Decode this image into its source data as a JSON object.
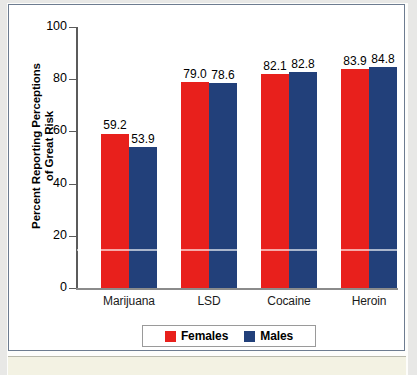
{
  "chart_data": {
    "type": "bar",
    "title": "",
    "subtitle": "",
    "xlabel": "",
    "ylabel": "Percent Reporting Perceptions of Great Risk",
    "ylabel_line1": "Percent Reporting Perceptions",
    "ylabel_line2": "of Great Risk",
    "ylim": [
      0,
      100
    ],
    "ytick_labels": [
      "100",
      "80",
      "60",
      "40",
      "20",
      "0"
    ],
    "ytick_values": [
      100,
      80,
      60,
      40,
      20,
      0
    ],
    "grid": false,
    "legend_position": "bottom-center",
    "categories": [
      "Marijuana",
      "LSD",
      "Cocaine",
      "Heroin"
    ],
    "series": [
      {
        "name": "Females",
        "color": "#e8201c",
        "values": [
          59.2,
          79.0,
          82.1,
          83.9
        ],
        "labels": [
          "59.2",
          "79.0",
          "82.1",
          "83.9"
        ]
      },
      {
        "name": "Males",
        "color": "#22407a",
        "values": [
          53.9,
          78.6,
          82.8,
          84.8
        ],
        "labels": [
          "53.9",
          "78.6",
          "82.8",
          "84.8"
        ]
      }
    ]
  },
  "legend": {
    "items": [
      {
        "label": "Females",
        "color": "#e8201c",
        "swatch": "legend-swatch-females"
      },
      {
        "label": "Males",
        "color": "#22407a",
        "swatch": "legend-swatch-males"
      }
    ]
  },
  "colors": {
    "female_bar": "#e8201c",
    "male_bar": "#22407a",
    "frame_border": "#6d7c90",
    "caption_band": "#f3f2e3",
    "axis": "#5b5b5b"
  }
}
